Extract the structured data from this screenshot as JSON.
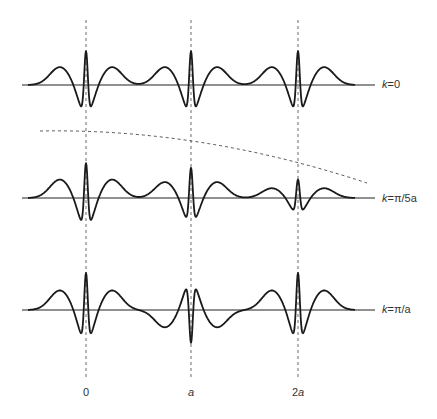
{
  "figure": {
    "rows": [
      {
        "id": "k0",
        "label_k": "k",
        "label_rest": "=0",
        "baseline_y": 85,
        "peak_heights": [
          64,
          64,
          64
        ],
        "center_sign": 1
      },
      {
        "id": "kpi5a",
        "label_k": "k",
        "label_rest": "=π/5a",
        "baseline_y": 198,
        "peak_heights": [
          66,
          57,
          35
        ],
        "center_sign": 1
      },
      {
        "id": "kpia",
        "label_k": "k",
        "label_rest": "=π/a",
        "baseline_y": 310,
        "peak_heights": [
          70,
          62,
          70
        ],
        "center_sign": -1
      }
    ],
    "x_axis": {
      "ticks": [
        {
          "label": "0",
          "x": 86
        },
        {
          "label": "a",
          "x": 191,
          "italic": true
        },
        {
          "label": "2a",
          "x": 298,
          "italic_part": "a",
          "prefix": "2"
        }
      ]
    },
    "envelope": {
      "style": "dashed",
      "from": [
        40,
        131
      ],
      "to": [
        367,
        183
      ]
    },
    "colors": {
      "curve": "#1a1a1a",
      "axis": "#222222",
      "dashed": "#444444",
      "text": "#333333"
    }
  }
}
